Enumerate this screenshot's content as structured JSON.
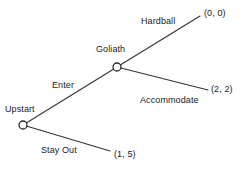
{
  "figure": {
    "type": "game-tree",
    "title": "",
    "background_color": "#ffffff",
    "line_color": "#333333",
    "text_color": "#1a1a1a",
    "node_fill_color": "#ffffff"
  },
  "nodes": [
    {
      "id": "upstart",
      "label": "Upstart",
      "x": 23,
      "y": 125,
      "radius": 4,
      "label_x": 5,
      "label_y": 104
    },
    {
      "id": "goliath",
      "label": "Goliath",
      "x": 117,
      "y": 67,
      "radius": 4,
      "label_x": 96,
      "label_y": 44
    }
  ],
  "branches": [
    {
      "id": "enter",
      "label": "Enter",
      "from": "upstart",
      "to": "goliath",
      "x1": 23,
      "y1": 125,
      "x2": 117,
      "y2": 67,
      "label_x": 52,
      "label_y": 80
    },
    {
      "id": "stay-out",
      "label": "Stay Out",
      "from": "upstart",
      "to": "terminal-stay-out",
      "x1": 23,
      "y1": 125,
      "x2": 110,
      "y2": 151,
      "label_x": 41,
      "label_y": 145
    },
    {
      "id": "hardball",
      "label": "Hardball",
      "from": "goliath",
      "to": "terminal-hardball",
      "x1": 117,
      "y1": 67,
      "x2": 200,
      "y2": 16,
      "label_x": 141,
      "label_y": 16
    },
    {
      "id": "accommodate",
      "label": "Accommodate",
      "from": "goliath",
      "to": "terminal-accommodate",
      "x1": 117,
      "y1": 67,
      "x2": 208,
      "y2": 90,
      "label_x": 140,
      "label_y": 95
    }
  ],
  "payoffs": [
    {
      "id": "terminal-hardball",
      "label": "(0, 0)",
      "x": 204,
      "y": 8,
      "player1": 0,
      "player2": 0
    },
    {
      "id": "terminal-accommodate",
      "label": "(2, 2)",
      "x": 211,
      "y": 84,
      "player1": 2,
      "player2": 2
    },
    {
      "id": "terminal-stay-out",
      "label": "(1, 5)",
      "x": 114,
      "y": 149,
      "player1": 1,
      "player2": 5
    }
  ]
}
